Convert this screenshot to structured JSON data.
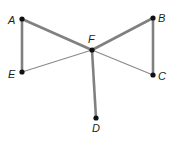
{
  "diagram": {
    "points": [
      {
        "name": "A",
        "x": 22,
        "y": 19,
        "lx": 8,
        "ly": 24
      },
      {
        "name": "B",
        "x": 153,
        "y": 18,
        "lx": 158,
        "ly": 22
      },
      {
        "name": "C",
        "x": 153,
        "y": 75,
        "lx": 158,
        "ly": 80
      },
      {
        "name": "D",
        "x": 96,
        "y": 118,
        "lx": 92,
        "ly": 132
      },
      {
        "name": "E",
        "x": 22,
        "y": 72,
        "lx": 8,
        "ly": 78
      },
      {
        "name": "F",
        "x": 92,
        "y": 50,
        "lx": 88,
        "ly": 43
      }
    ],
    "thick_segments": [
      [
        "A",
        "F"
      ],
      [
        "F",
        "B"
      ],
      [
        "A",
        "E"
      ],
      [
        "B",
        "C"
      ],
      [
        "F",
        "D"
      ]
    ],
    "thin_segments": [
      [
        "E",
        "F"
      ],
      [
        "F",
        "C"
      ]
    ],
    "colors": {
      "thick": "#808080",
      "thin": "#8a8a8a",
      "point": "#111111",
      "label": "#231f20"
    }
  }
}
